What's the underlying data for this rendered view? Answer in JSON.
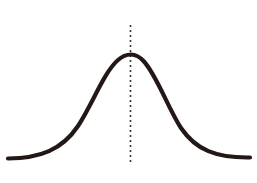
{
  "figure": {
    "caption": "規分布)",
    "background_color": "#ffffff",
    "width": 257,
    "height": 183
  },
  "style": {
    "curve_color": "#231815",
    "curve_width": 4.2,
    "axis_line_color": "#3a322f",
    "axis_line_width": 1.6,
    "axis_dash_pattern": "2 3"
  },
  "chart_data": {
    "type": "line",
    "title": "規分布)",
    "subtitle": "",
    "xlabel": "",
    "ylabel": "",
    "grid": false,
    "legend_position": "none",
    "xlim": [
      -4,
      4
    ],
    "ylim": [
      0,
      1
    ],
    "annotations": [
      {
        "name": "mean-line",
        "type": "vertical-dashed-line",
        "x": 0,
        "label": "",
        "y_top": 1.08,
        "y_bottom": -0.05
      }
    ],
    "series": [
      {
        "name": "normal distribution",
        "curve": "gaussian",
        "mean": 0,
        "std_dev": 1,
        "x": [
          -4.0,
          -3.6,
          -3.2,
          -2.8,
          -2.4,
          -2.0,
          -1.6,
          -1.2,
          -0.8,
          -0.4,
          0.0,
          0.4,
          0.8,
          1.2,
          1.6,
          2.0,
          2.4,
          2.8,
          3.2,
          3.6,
          4.0
        ],
        "values": [
          0.0,
          0.0,
          0.01,
          0.02,
          0.06,
          0.14,
          0.28,
          0.49,
          0.73,
          0.92,
          1.0,
          0.92,
          0.73,
          0.49,
          0.28,
          0.14,
          0.06,
          0.02,
          0.01,
          0.0,
          0.0
        ]
      }
    ]
  },
  "geometry": {
    "curve_path": "M 8,158.5 C 40,158 62,150 78,126 C 92,105 104,72 118,60 C 123,55.5 128,54.5 131,54.5 C 134.5,54.5 139,56 144,61.5 C 157,76 168,108 181,128 C 196,150 216,158 250,157.5",
    "mean_line_x": 130.5,
    "mean_line_y_top": 25,
    "mean_line_y_bottom": 164
  }
}
